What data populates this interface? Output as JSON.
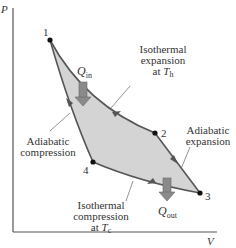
{
  "diagram": {
    "type": "Carnot cycle P-V diagram",
    "axes": {
      "y_label": "P",
      "x_label": "V"
    },
    "points": [
      {
        "id": "1",
        "label": "1"
      },
      {
        "id": "2",
        "label": "2"
      },
      {
        "id": "3",
        "label": "3"
      },
      {
        "id": "4",
        "label": "4"
      }
    ],
    "heat": {
      "in": {
        "symbol": "Q",
        "subscript": "in"
      },
      "out": {
        "symbol": "Q",
        "subscript": "out"
      }
    },
    "processes": {
      "isothermal_expansion": {
        "line1": "Isothermal",
        "line2": "expansion",
        "line3_prefix": "at ",
        "temp_symbol": "T",
        "temp_sub": "h"
      },
      "adiabatic_expansion": {
        "line1": "Adiabatic",
        "line2": "expansion"
      },
      "isothermal_compression": {
        "line1": "Isothermal",
        "line2": "compression",
        "line3_prefix": "at ",
        "temp_symbol": "T",
        "temp_sub": "c"
      },
      "adiabatic_compression": {
        "line1": "Adiabatic",
        "line2": "compression"
      }
    },
    "colors": {
      "fill": "#d4d4d4",
      "curve": "#555555",
      "arrow": "#8a8a8a",
      "axis": "#555555",
      "point": "#111111"
    }
  }
}
